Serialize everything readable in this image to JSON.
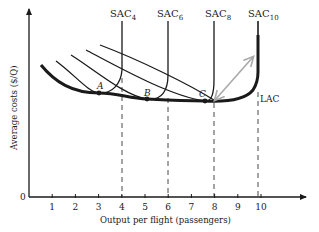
{
  "diagram": {
    "title": "",
    "y_axis": {
      "label": "Average costs ($/Q)",
      "origin_label": "0"
    },
    "x_axis": {
      "label": "Output per flight (passengers)",
      "ticks": [
        "1",
        "2",
        "3",
        "4",
        "5",
        "6",
        "7",
        "8",
        "9",
        "10"
      ]
    },
    "curves": [
      {
        "name": "SAC",
        "subscript": "4",
        "capacity": 4
      },
      {
        "name": "SAC",
        "subscript": "6",
        "capacity": 6
      },
      {
        "name": "SAC",
        "subscript": "8",
        "capacity": 8
      },
      {
        "name": "SAC",
        "subscript": "10",
        "capacity": 10
      }
    ],
    "envelope_label": "LAC",
    "points": [
      {
        "label": "A",
        "x": 3.0
      },
      {
        "label": "B",
        "x": 5.1
      },
      {
        "label": "C",
        "x": 7.6
      }
    ],
    "arrow": {
      "type": "double-headed",
      "color": "#a9a9a9"
    },
    "colors": {
      "ink": "#1a1a1a",
      "arrow": "#a9a9a9"
    }
  }
}
